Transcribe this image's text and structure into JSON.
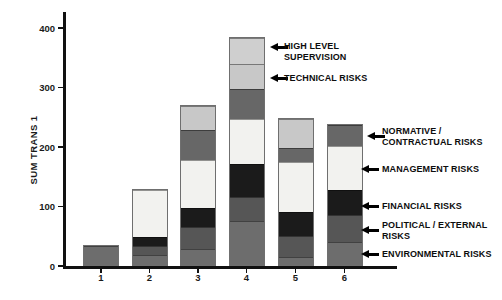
{
  "page": {
    "background": "#ffffff"
  },
  "chart_data": {
    "type": "bar",
    "variant": "stacked",
    "title": "",
    "ylabel": "SUM TRANS 1",
    "xlabel": "",
    "categories": [
      "1",
      "2",
      "3",
      "4",
      "5",
      "6"
    ],
    "ylim": [
      0,
      400
    ],
    "yticks": [
      0,
      100,
      200,
      300,
      400
    ],
    "grid": false,
    "legend": "none (arrow annotations instead)",
    "series": [
      {
        "name": "ENVIRONMENTAL RISKS",
        "color": "#6d6d6d",
        "values": [
          35,
          18,
          27,
          74,
          13,
          40
        ]
      },
      {
        "name": "POLITICAL / EXTERNAL RISKS",
        "color": "#565656",
        "values": [
          0,
          14,
          37,
          41,
          36,
          46
        ]
      },
      {
        "name": "FINANCIAL RISKS",
        "color": "#1b1b1b",
        "values": [
          0,
          17,
          33,
          57,
          42,
          42
        ]
      },
      {
        "name": "MANAGEMENT RISKS",
        "color": "#f2f2ef",
        "values": [
          0,
          80,
          81,
          76,
          84,
          75
        ]
      },
      {
        "name": "NORMATIVE / CONTRACTUAL RISKS",
        "color": "#676767",
        "values": [
          0,
          0,
          51,
          50,
          25,
          36
        ]
      },
      {
        "name": "TECHNICAL RISKS",
        "color": "#c8c8c8",
        "values": [
          0,
          0,
          42,
          42,
          49,
          0
        ]
      },
      {
        "name": "HIGH LEVEL SUPERVISION",
        "color": "#cfcfcf",
        "values": [
          0,
          0,
          0,
          45,
          0,
          0
        ]
      }
    ],
    "annotations": [
      {
        "label": "HIGH LEVEL SUPERVISION",
        "lines": [
          "HIGH LEVEL",
          "SUPERVISION"
        ],
        "points_to_bar": "4",
        "arrow_x": 270,
        "arrow_y": 47,
        "text_x": 284,
        "text_y": 41
      },
      {
        "label": "TECHNICAL RISKS",
        "lines": [
          "TECHNICAL RISKS"
        ],
        "points_to_bar": "4",
        "arrow_x": 270,
        "arrow_y": 78,
        "text_x": 284,
        "text_y": 73
      },
      {
        "label": "NORMATIVE / CONTRACTUAL RISKS",
        "lines": [
          "NORMATIVE /",
          "CONTRACTUAL RISKS"
        ],
        "points_to_bar": "6",
        "arrow_x": 367,
        "arrow_y": 136,
        "text_x": 382,
        "text_y": 126
      },
      {
        "label": "MANAGEMENT RISKS",
        "lines": [
          "MANAGEMENT RISKS"
        ],
        "points_to_bar": "6",
        "arrow_x": 361,
        "arrow_y": 169,
        "text_x": 382,
        "text_y": 164
      },
      {
        "label": "FINANCIAL RISKS",
        "lines": [
          "FINANCIAL RISKS"
        ],
        "points_to_bar": "6",
        "arrow_x": 361,
        "arrow_y": 206,
        "text_x": 382,
        "text_y": 201
      },
      {
        "label": "POLITICAL / EXTERNAL RISKS",
        "lines": [
          "POLITICAL / EXTERNAL",
          "RISKS"
        ],
        "points_to_bar": "6",
        "arrow_x": 361,
        "arrow_y": 230,
        "text_x": 382,
        "text_y": 220
      },
      {
        "label": "ENVIRONMENTAL RISKS",
        "lines": [
          "ENVIRONMENTAL RISKS"
        ],
        "points_to_bar": "6",
        "arrow_x": 361,
        "arrow_y": 254,
        "text_x": 382,
        "text_y": 249
      }
    ]
  }
}
